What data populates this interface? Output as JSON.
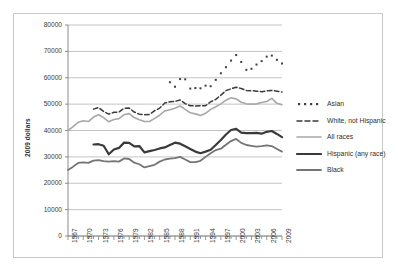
{
  "chart_data": {
    "type": "line",
    "title": "",
    "xlabel": "",
    "ylabel": "2009 dollars",
    "ylim": [
      0,
      80000
    ],
    "xlim": [
      1967,
      2009
    ],
    "grid": true,
    "grid_axis": "y",
    "legend_position": "right",
    "ytick_labels": [
      "0",
      "10000",
      "20000",
      "30000",
      "40000",
      "50000",
      "60000",
      "70000",
      "80000"
    ],
    "ytick_values": [
      0,
      10000,
      20000,
      30000,
      40000,
      50000,
      60000,
      70000,
      80000
    ],
    "xtick_labels": [
      "1967",
      "1970",
      "1973",
      "1976",
      "1979",
      "1982",
      "1985",
      "1988",
      "1991",
      "1994",
      "1997",
      "2000",
      "2003",
      "2006",
      "2009"
    ],
    "xtick_values": [
      1967,
      1970,
      1973,
      1976,
      1979,
      1982,
      1985,
      1988,
      1991,
      1994,
      1997,
      2000,
      2003,
      2006,
      2009
    ],
    "minor_xticks_every_year": true,
    "series": [
      {
        "name": "Asian",
        "style": "dotted",
        "color": "#404040",
        "x": [
          1987,
          1988,
          1989,
          1990,
          1991,
          1992,
          1993,
          1994,
          1995,
          1996,
          1997,
          1998,
          1999,
          2000,
          2001,
          2002,
          2003,
          2004,
          2005,
          2006,
          2007,
          2008,
          2009
        ],
        "values": [
          58300,
          56600,
          59500,
          59400,
          55900,
          56100,
          56000,
          57000,
          56800,
          59200,
          61700,
          64000,
          66500,
          68600,
          66000,
          63000,
          63400,
          65000,
          66300,
          68000,
          68400,
          66800,
          65400
        ]
      },
      {
        "name": "White, not Hispanic",
        "style": "dashed",
        "color": "#3a3a3a",
        "x": [
          1972,
          1973,
          1974,
          1975,
          1976,
          1977,
          1978,
          1979,
          1980,
          1981,
          1982,
          1983,
          1984,
          1985,
          1986,
          1987,
          1988,
          1989,
          1990,
          1991,
          1992,
          1993,
          1994,
          1995,
          1996,
          1997,
          1998,
          1999,
          2000,
          2001,
          2002,
          2003,
          2004,
          2005,
          2006,
          2007,
          2008,
          2009
        ],
        "values": [
          48100,
          48700,
          47200,
          46200,
          46900,
          47000,
          48400,
          48500,
          47000,
          46200,
          46000,
          46100,
          47500,
          48500,
          50400,
          50900,
          51000,
          51600,
          50200,
          49400,
          49300,
          49400,
          49400,
          50900,
          51800,
          53400,
          55100,
          55800,
          56400,
          55900,
          55200,
          55100,
          54900,
          54700,
          55000,
          55200,
          54900,
          54600
        ]
      },
      {
        "name": "All races",
        "style": "solid",
        "color": "#a8a8a8",
        "width": 1.6,
        "x": [
          1967,
          1968,
          1969,
          1970,
          1971,
          1972,
          1973,
          1974,
          1975,
          1976,
          1977,
          1978,
          1979,
          1980,
          1981,
          1982,
          1983,
          1984,
          1985,
          1986,
          1987,
          1988,
          1989,
          1990,
          1991,
          1992,
          1993,
          1994,
          1995,
          1996,
          1997,
          1998,
          1999,
          2000,
          2001,
          2002,
          2003,
          2004,
          2005,
          2006,
          2007,
          2008,
          2009
        ],
        "values": [
          40000,
          41500,
          43100,
          43700,
          43400,
          45100,
          46000,
          44900,
          43300,
          44200,
          44500,
          46000,
          46400,
          44900,
          44100,
          43400,
          43400,
          44600,
          45800,
          47400,
          47900,
          48400,
          49300,
          48000,
          46700,
          46300,
          45700,
          46500,
          48000,
          49000,
          50100,
          51500,
          52400,
          52000,
          50700,
          50100,
          50000,
          50100,
          50600,
          51000,
          52200,
          50300,
          49800
        ]
      },
      {
        "name": "Hispanic (any race)",
        "style": "solid",
        "color": "#3a3a3a",
        "width": 2.2,
        "x": [
          1972,
          1973,
          1974,
          1975,
          1976,
          1977,
          1978,
          1979,
          1980,
          1981,
          1982,
          1983,
          1984,
          1985,
          1986,
          1987,
          1988,
          1989,
          1990,
          1991,
          1992,
          1993,
          1994,
          1995,
          1996,
          1997,
          1998,
          1999,
          2000,
          2001,
          2002,
          2003,
          2004,
          2005,
          2006,
          2007,
          2008,
          2009
        ],
        "values": [
          34700,
          34800,
          34200,
          31000,
          32800,
          33400,
          35400,
          35300,
          34000,
          34100,
          31700,
          32200,
          32600,
          33200,
          33600,
          34500,
          35400,
          35000,
          34000,
          33000,
          32000,
          31400,
          32000,
          32700,
          34500,
          36400,
          38500,
          40200,
          40600,
          39200,
          39000,
          39000,
          39100,
          38800,
          39500,
          39800,
          38700,
          37500
        ]
      },
      {
        "name": "Black",
        "style": "solid",
        "color": "#757575",
        "width": 1.8,
        "x": [
          1967,
          1968,
          1969,
          1970,
          1971,
          1972,
          1973,
          1974,
          1975,
          1976,
          1977,
          1978,
          1979,
          1980,
          1981,
          1982,
          1983,
          1984,
          1985,
          1986,
          1987,
          1988,
          1989,
          1990,
          1991,
          1992,
          1993,
          1994,
          1995,
          1996,
          1997,
          1998,
          1999,
          2000,
          2001,
          2002,
          2003,
          2004,
          2005,
          2006,
          2007,
          2008,
          2009
        ],
        "values": [
          25000,
          26300,
          27700,
          27900,
          27700,
          28600,
          28800,
          28400,
          28200,
          28400,
          28200,
          29400,
          29200,
          27800,
          27200,
          26000,
          26500,
          27000,
          28200,
          29000,
          29300,
          29500,
          30000,
          29000,
          28000,
          28000,
          28500,
          30000,
          31400,
          32600,
          33100,
          34600,
          36000,
          36800,
          35300,
          34500,
          34200,
          33900,
          34100,
          34400,
          34100,
          33000,
          32000
        ]
      }
    ]
  },
  "legend": {
    "items": [
      {
        "label": "Asian",
        "marker": "dotted-line"
      },
      {
        "label": "White, not Hispanic",
        "marker": "dashed-line"
      },
      {
        "label": "All races",
        "marker": "solid-light-line"
      },
      {
        "label": "Hispanic (any race)",
        "marker": "solid-dark-thick-line"
      },
      {
        "label": "Black",
        "marker": "solid-gray-line"
      }
    ]
  },
  "colors": {
    "asian": "#404040",
    "white_not_hispanic": "#3a3a3a",
    "all_races": "#a8a8a8",
    "hispanic": "#3a3a3a",
    "black": "#757575",
    "gridline": "#b5b5b5",
    "axis": "#808080",
    "frame": "#c9c9c9",
    "background": "#ffffff"
  }
}
